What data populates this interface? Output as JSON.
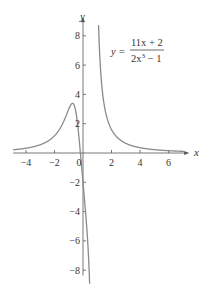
{
  "chart_data": {
    "type": "line",
    "title": "",
    "function": "y = (11x + 2) / (2x^3 - 1)",
    "equation_label": {
      "lhs": "y =",
      "numerator": "11x + 2",
      "denominator_base": "2x",
      "denominator_exp": "3",
      "denominator_rest": " − 1"
    },
    "xlabel": "x",
    "ylabel": "y",
    "xlim": [
      -4.9,
      7.1
    ],
    "ylim": [
      -8.5,
      9.0
    ],
    "x_ticks": [
      -4,
      -2,
      0,
      2,
      4,
      6
    ],
    "x_tick_labels": [
      "−4",
      "−2",
      "0",
      "2",
      "4",
      "6"
    ],
    "y_ticks": [
      -8,
      -6,
      -4,
      -2,
      2,
      4,
      6,
      8
    ],
    "y_tick_labels": [
      "−8",
      "−6",
      "−4",
      "−2",
      "2",
      "4",
      "6",
      "8"
    ],
    "grid": false,
    "legend": "none",
    "vertical_asymptote_x": 0.794,
    "horizontal_asymptote_y": 0,
    "key_points": [
      {
        "label": "local max",
        "x": -0.8,
        "y": 3.4
      },
      {
        "label": "x-intercept",
        "x": -0.18,
        "y": 0
      },
      {
        "label": "y-intercept",
        "x": 0,
        "y": -2
      }
    ],
    "series": [
      {
        "name": "y = (11x+2)/(2x^3-1)",
        "x": [
          -4.9,
          -4,
          -3,
          -2,
          -1.5,
          -1.2,
          -1,
          -0.8,
          -0.6,
          -0.4,
          -0.2,
          0,
          0.2,
          0.4,
          0.6,
          0.7,
          0.75,
          1.0,
          1.2,
          1.5,
          2,
          3,
          4,
          6,
          7
        ],
        "y": [
          0.22,
          0.33,
          0.56,
          1.18,
          1.85,
          2.53,
          3.0,
          3.38,
          3.27,
          1.8,
          -0.15,
          -2.0,
          -4.2,
          -7.1,
          -15.1,
          -30.6,
          -57.5,
          13.0,
          6.25,
          3.07,
          1.6,
          0.66,
          0.36,
          0.16,
          0.12
        ]
      }
    ],
    "colors": {
      "curve": "#8a8a8a",
      "axes": "#555555",
      "text": "#333333"
    }
  }
}
